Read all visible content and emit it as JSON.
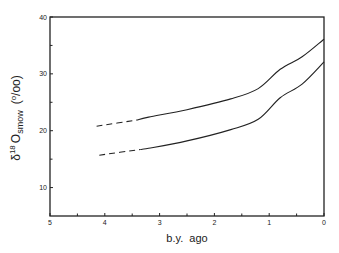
{
  "chart_data": {
    "type": "line",
    "title": "",
    "xlabel": "b.y.  ago",
    "ylabel": "δ18 O smow (o/oo)",
    "ylabel_parts": {
      "delta": "δ",
      "sup": "18",
      "O": "O",
      "sub": "smow",
      "unit": "(o/oo)",
      "unit_o": "o",
      "unit_rest": "/oo"
    },
    "xlim": [
      5,
      0
    ],
    "ylim": [
      5,
      40
    ],
    "x_ticks": [
      5,
      4,
      3,
      2,
      1,
      0
    ],
    "x_minor_ticks": [
      4.5,
      3.5,
      2.5,
      1.5,
      0.5
    ],
    "y_ticks": [
      10,
      20,
      30,
      40
    ],
    "y_minor_ticks": [
      15,
      25,
      35
    ],
    "grid": false,
    "legend": null,
    "series": [
      {
        "name": "upper curve",
        "x": [
          4.15,
          3.4,
          3.2,
          2.5,
          1.7,
          1.2,
          0.8,
          0.4,
          0
        ],
        "values": [
          20.8,
          21.9,
          22.4,
          23.7,
          25.6,
          27.4,
          30.8,
          33.0,
          36.1
        ],
        "dashed_until": 3.4
      },
      {
        "name": "lower curve",
        "x": [
          4.1,
          3.35,
          3.2,
          2.5,
          1.7,
          1.2,
          0.8,
          0.4,
          0
        ],
        "values": [
          15.7,
          16.7,
          16.9,
          18.2,
          20.2,
          22.0,
          25.8,
          28.2,
          32.1
        ],
        "dashed_until": 3.35
      }
    ]
  }
}
